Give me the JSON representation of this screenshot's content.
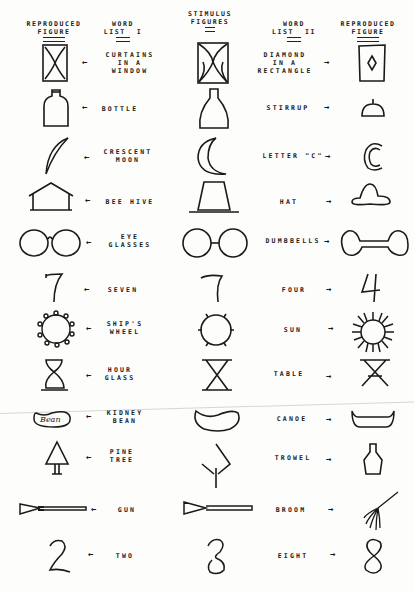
{
  "headers": {
    "reproduced_1": "REPRODUCED\nFIGURE",
    "word_list_1": "WORD\nLIST  I",
    "stimulus": "STIMULUS\nFIGURES",
    "word_list_2": "WORD\nLIST  II",
    "reproduced_2": "REPRODUCED\nFIGURE"
  },
  "arrows": {
    "left": "←",
    "right": "→"
  },
  "rows": [
    {
      "stimulus": "curtains-rectangle",
      "word1": "CURTAINS\nIN A\nWINDOW",
      "word2": "DIAMOND\nIN A\nRECTANGLE"
    },
    {
      "stimulus": "bottle-stirrup",
      "word1": "BOTTLE",
      "word2": "STIRRUP"
    },
    {
      "stimulus": "crescent",
      "word1": "CRESCENT\nMOON",
      "word2": "LETTER \"C\""
    },
    {
      "stimulus": "trapezoid",
      "word1": "BEE HIVE",
      "word2": "HAT"
    },
    {
      "stimulus": "two-circles",
      "word1": "EYE\nGLASSES",
      "word2": "DUMBBELLS"
    },
    {
      "stimulus": "seven-four",
      "word1": "SEVEN",
      "word2": "FOUR"
    },
    {
      "stimulus": "circle-ticks",
      "word1": "SHIP'S\nWHEEL",
      "word2": "SUN"
    },
    {
      "stimulus": "x-bars",
      "word1": "HOUR\nGLASS",
      "word2": "TABLE"
    },
    {
      "stimulus": "kidney",
      "word1": "KIDNEY\nBEAN",
      "word2": "CANOE"
    },
    {
      "stimulus": "diamond-stem",
      "word1": "PINE\nTREE",
      "word2": "TROWEL"
    },
    {
      "stimulus": "triangle-rod",
      "word1": "GUN",
      "word2": "BROOM"
    },
    {
      "stimulus": "s-loop",
      "word1": "TWO",
      "word2": "EIGHT"
    }
  ],
  "reproduced_text": {
    "bean_label": "Bean"
  }
}
